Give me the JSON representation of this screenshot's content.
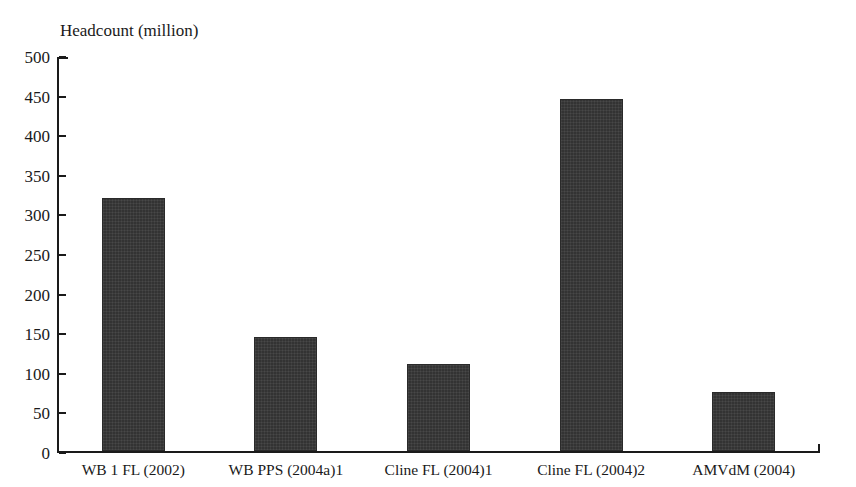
{
  "figure": {
    "clipped_caption_above": "",
    "y_axis_title": "Headcount (million)"
  },
  "chart_data": {
    "type": "bar",
    "title": "",
    "subtitle": "",
    "xlabel": "",
    "ylabel": "Headcount (million)",
    "ylim": [
      0,
      500
    ],
    "yticks": [
      0,
      50,
      100,
      150,
      200,
      250,
      300,
      350,
      400,
      450,
      500
    ],
    "ytick_labels": [
      "0",
      "50",
      "100",
      "150",
      "200",
      "250",
      "300",
      "350",
      "400",
      "450",
      "500"
    ],
    "grid": false,
    "legend": null,
    "bar_color": "#333333",
    "categories": [
      "WB 1 FL (2002)",
      "WB PPS (2004a)1",
      "Cline FL (2004)1",
      "Cline FL (2004)2",
      "AMVdM (2004)"
    ],
    "values": [
      320,
      144,
      110,
      444,
      74
    ],
    "annotations": []
  }
}
